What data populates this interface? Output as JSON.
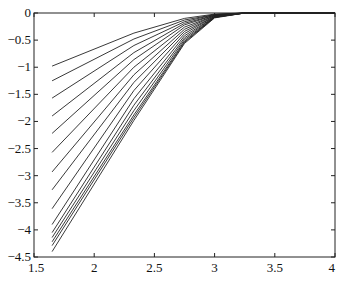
{
  "chart_data": {
    "type": "line",
    "title": "",
    "xlabel": "",
    "ylabel": "",
    "xlim": [
      1.5,
      4
    ],
    "ylim": [
      -4.5,
      0
    ],
    "grid": false,
    "legend": null,
    "x_ticks": [
      1.5,
      2,
      2.5,
      3,
      3.5,
      4
    ],
    "x_tick_labels": [
      "1.5",
      "2",
      "2.5",
      "3",
      "3.5",
      "4"
    ],
    "y_ticks": [
      0,
      -0.5,
      -1,
      -1.5,
      -2,
      -2.5,
      -3,
      -3.5,
      -4,
      -4.5
    ],
    "y_tick_labels": [
      "0",
      "-0.5",
      "-1",
      "-1.5",
      "-2",
      "-2.5",
      "-3",
      "-3.5",
      "-4",
      "-4.5"
    ],
    "x": [
      1.65,
      2.33,
      2.75,
      3.0,
      3.25,
      4.0
    ],
    "series": [
      {
        "name": "curve-1",
        "values": [
          -0.98,
          -0.37,
          -0.1,
          -0.02,
          0,
          0
        ]
      },
      {
        "name": "curve-2",
        "values": [
          -1.25,
          -0.48,
          -0.13,
          -0.03,
          0,
          0
        ]
      },
      {
        "name": "curve-3",
        "values": [
          -1.57,
          -0.6,
          -0.16,
          -0.03,
          0,
          0
        ]
      },
      {
        "name": "curve-4",
        "values": [
          -1.9,
          -0.73,
          -0.19,
          -0.04,
          0,
          0
        ]
      },
      {
        "name": "curve-5",
        "values": [
          -2.22,
          -0.86,
          -0.22,
          -0.04,
          0,
          0
        ]
      },
      {
        "name": "curve-6",
        "values": [
          -2.57,
          -1.0,
          -0.26,
          -0.05,
          0,
          0
        ]
      },
      {
        "name": "curve-7",
        "values": [
          -2.93,
          -1.14,
          -0.3,
          -0.05,
          0,
          0
        ]
      },
      {
        "name": "curve-8",
        "values": [
          -3.26,
          -1.28,
          -0.34,
          -0.06,
          0,
          0
        ]
      },
      {
        "name": "curve-9",
        "values": [
          -3.61,
          -1.43,
          -0.38,
          -0.06,
          0,
          0
        ]
      },
      {
        "name": "curve-10",
        "values": [
          -3.9,
          -1.58,
          -0.42,
          -0.07,
          0,
          0
        ]
      },
      {
        "name": "curve-11",
        "values": [
          -4.05,
          -1.7,
          -0.46,
          -0.07,
          0,
          0
        ]
      },
      {
        "name": "curve-12",
        "values": [
          -4.14,
          -1.8,
          -0.49,
          -0.08,
          0,
          0
        ]
      },
      {
        "name": "curve-13",
        "values": [
          -4.22,
          -1.88,
          -0.52,
          -0.08,
          0,
          0
        ]
      },
      {
        "name": "curve-14",
        "values": [
          -4.29,
          -1.93,
          -0.54,
          -0.08,
          0,
          0
        ]
      },
      {
        "name": "curve-15",
        "values": [
          -4.4,
          -1.98,
          -0.56,
          -0.09,
          0,
          0
        ]
      }
    ],
    "colors": {
      "line": "#222222",
      "axis": "#222222",
      "background": "#ffffff"
    }
  }
}
